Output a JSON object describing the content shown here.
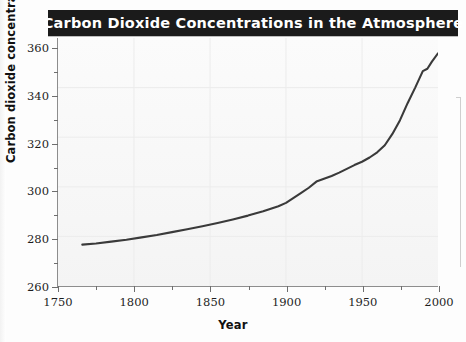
{
  "figure": {
    "title": "Carbon Dioxide Concentrations in the Atmosphere",
    "title_bar_color": "#1b1b1b",
    "title_text_color": "#ffffff",
    "plot_background": "#f7f7f7",
    "line_color": "#3a3a3a"
  },
  "axes": {
    "y_axis_title": "Carbon dioxide concentrations (ppm)",
    "x_axis_title": "Year",
    "y_tick_labels": [
      "260",
      "280",
      "300",
      "320",
      "340",
      "360"
    ],
    "x_tick_labels": [
      "1750",
      "1800",
      "1850",
      "1900",
      "1950",
      "2000"
    ],
    "y_minor_ticks": [
      "270",
      "290",
      "310",
      "330",
      "350"
    ],
    "x_minor_ticks": [
      "1775",
      "1825",
      "1875",
      "1925",
      "1975"
    ]
  },
  "chart_data": {
    "type": "line",
    "title": "Carbon Dioxide Concentrations in the Atmosphere",
    "xlabel": "Year",
    "ylabel": "Carbon dioxide concentrations (ppm)",
    "xlim": [
      1750,
      2000
    ],
    "ylim": [
      260,
      365
    ],
    "xticks": [
      1750,
      1800,
      1850,
      1900,
      1950,
      2000
    ],
    "yticks": [
      260,
      280,
      300,
      320,
      340,
      360
    ],
    "grid": true,
    "legend": "none",
    "series": [
      {
        "name": "Atmospheric CO2 concentration",
        "color": "#3a3a3a",
        "x": [
          1766,
          1775,
          1785,
          1795,
          1805,
          1815,
          1825,
          1835,
          1845,
          1855,
          1865,
          1875,
          1885,
          1895,
          1900,
          1910,
          1915,
          1920,
          1925,
          1930,
          1935,
          1940,
          1945,
          1950,
          1955,
          1960,
          1965,
          1970,
          1975,
          1980,
          1985,
          1990,
          1993,
          1996,
          2000
        ],
        "y": [
          277.5,
          278.0,
          278.8,
          279.6,
          280.6,
          281.6,
          282.8,
          284.0,
          285.3,
          286.7,
          288.2,
          289.8,
          291.6,
          293.8,
          295.2,
          299.4,
          301.6,
          304.2,
          305.4,
          306.6,
          308.0,
          309.6,
          311.2,
          312.6,
          314.4,
          316.6,
          319.6,
          324.4,
          330.2,
          337.4,
          344.0,
          351.0,
          352.0,
          355.0,
          358.5
        ]
      }
    ]
  }
}
